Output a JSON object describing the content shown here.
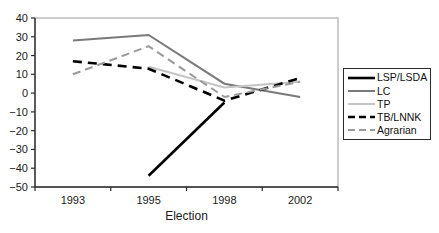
{
  "chart_data": {
    "type": "line",
    "title": "",
    "xlabel": "Election",
    "ylabel": "",
    "categories": [
      "1993",
      "1995",
      "1998",
      "2002"
    ],
    "ylim": [
      -50,
      40
    ],
    "ytick_step": 10,
    "yticks": [
      40,
      30,
      20,
      10,
      0,
      -10,
      -20,
      -30,
      -40,
      -50
    ],
    "ytick_labels": [
      "40",
      "30",
      "20",
      "10",
      "0",
      "−10",
      "−20",
      "−30",
      "−40",
      "−50"
    ],
    "grid": false,
    "plot_frame": true,
    "legend_position": "right",
    "series": [
      {
        "name": "LSP/LSDA",
        "values": [
          null,
          -44,
          -5,
          null
        ],
        "color": "#000000",
        "dash": "",
        "width": 2.6
      },
      {
        "name": "LC",
        "values": [
          28,
          31,
          5,
          -2
        ],
        "color": "#7a7a7a",
        "dash": "",
        "width": 2.0
      },
      {
        "name": "TP",
        "values": [
          null,
          14,
          3,
          6
        ],
        "color": "#c4c4c4",
        "dash": "",
        "width": 2.0
      },
      {
        "name": "TB/LNNK",
        "values": [
          17,
          13,
          -4,
          8
        ],
        "color": "#000000",
        "dash": "9 6",
        "width": 2.6
      },
      {
        "name": "Agrarian",
        "values": [
          10,
          25,
          -2,
          6
        ],
        "color": "#9a9a9a",
        "dash": "8 5",
        "width": 2.0
      }
    ],
    "axis_color": "#2b2b2b",
    "frame_color": "#9a9a9a"
  }
}
